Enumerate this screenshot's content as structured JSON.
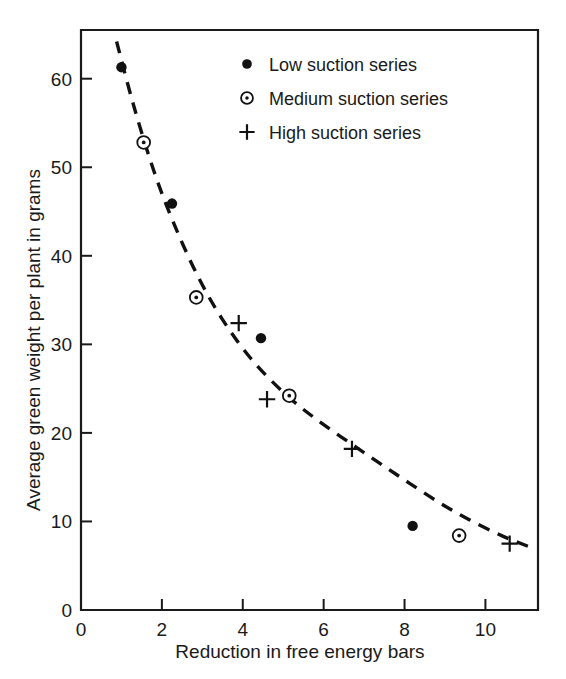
{
  "chart_data": {
    "type": "scatter",
    "title": "",
    "xlabel": "Reduction in free energy bars",
    "ylabel": "Average green weight per plant in grams",
    "xlim": [
      0,
      11.3
    ],
    "ylim": [
      0,
      65.5
    ],
    "xticks": [
      0,
      2,
      4,
      6,
      8,
      10
    ],
    "xticklabels": [
      "0",
      "2",
      "4",
      "6",
      "8",
      "10"
    ],
    "yticks": [
      0,
      10,
      20,
      30,
      40,
      50,
      60
    ],
    "yticklabels": [
      "0",
      "10",
      "20",
      "30",
      "40",
      "50",
      "60"
    ],
    "grid": false,
    "legend_position": "upper right",
    "series": [
      {
        "name": "Low suction series",
        "marker": "filled-circle",
        "points": [
          {
            "x": 1.0,
            "y": 61.3
          },
          {
            "x": 2.25,
            "y": 45.9
          },
          {
            "x": 4.45,
            "y": 30.7
          },
          {
            "x": 8.2,
            "y": 9.5
          }
        ]
      },
      {
        "name": "Medium suction series",
        "marker": "dotted-circle",
        "points": [
          {
            "x": 1.55,
            "y": 52.8
          },
          {
            "x": 2.85,
            "y": 35.3
          },
          {
            "x": 5.15,
            "y": 24.2
          },
          {
            "x": 9.35,
            "y": 8.4
          }
        ]
      },
      {
        "name": "High suction series",
        "marker": "plus",
        "points": [
          {
            "x": 3.9,
            "y": 32.4
          },
          {
            "x": 4.6,
            "y": 23.8
          },
          {
            "x": 6.7,
            "y": 18.2
          },
          {
            "x": 10.6,
            "y": 7.5
          }
        ]
      }
    ],
    "trendline": {
      "style": "dashed",
      "points": [
        {
          "x": 0.88,
          "y": 64.2
        },
        {
          "x": 1.3,
          "y": 57.0
        },
        {
          "x": 1.8,
          "y": 49.6
        },
        {
          "x": 2.3,
          "y": 43.6
        },
        {
          "x": 2.9,
          "y": 37.6
        },
        {
          "x": 3.5,
          "y": 32.8
        },
        {
          "x": 4.2,
          "y": 28.4
        },
        {
          "x": 5.0,
          "y": 24.6
        },
        {
          "x": 5.8,
          "y": 21.6
        },
        {
          "x": 6.8,
          "y": 18.4
        },
        {
          "x": 7.8,
          "y": 15.3
        },
        {
          "x": 8.8,
          "y": 12.3
        },
        {
          "x": 9.6,
          "y": 10.2
        },
        {
          "x": 10.4,
          "y": 8.4
        },
        {
          "x": 11.05,
          "y": 7.2
        }
      ]
    }
  },
  "legend": {
    "items": [
      {
        "label": "Low suction series",
        "marker": "filled-circle"
      },
      {
        "label": "Medium suction series",
        "marker": "dotted-circle"
      },
      {
        "label": "High suction series",
        "marker": "plus"
      }
    ]
  },
  "colors": {
    "ink": "#111111",
    "background": "#ffffff"
  }
}
